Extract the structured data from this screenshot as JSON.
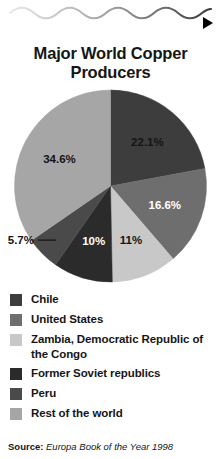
{
  "decoration": {
    "wave_name": "wavy-rule",
    "arrow_name": "right-triangle-marker"
  },
  "title": "Major World Copper Producers",
  "source": {
    "label": "Source:",
    "citation": "Europa Book of the Year 1998"
  },
  "chart_data": {
    "type": "pie",
    "title": "Major World Copper Producers",
    "unit": "percent",
    "start_angle_deg": 0,
    "direction": "clockwise",
    "categories": [
      "Chile",
      "United States",
      "Zambia, Democratic Republic of the Congo",
      "Former Soviet republics",
      "Peru",
      "Rest of the world"
    ],
    "values": [
      22.1,
      16.6,
      11,
      10,
      5.7,
      34.6
    ],
    "data_labels": [
      "22.1%",
      "16.6%",
      "11%",
      "10%",
      "5.7%",
      "34.6%"
    ],
    "colors": [
      "#3d3d3d",
      "#6e6e6e",
      "#c8c8c8",
      "#2b2b2b",
      "#4a4a4a",
      "#a6a6a6"
    ],
    "label_placement": [
      "inside",
      "inside",
      "inside",
      "inside",
      "outside",
      "inside"
    ],
    "label_text_colors": [
      "#141414",
      "#ffffff",
      "#141414",
      "#ffffff",
      "#141414",
      "#141414"
    ],
    "legend_position": "bottom",
    "source": "Europa Book of the Year 1998"
  },
  "legend": {
    "items": [
      {
        "label": "Chile",
        "color": "#3d3d3d",
        "value": 22.1
      },
      {
        "label": "United States",
        "color": "#6e6e6e",
        "value": 16.6
      },
      {
        "label": "Zambia, Democratic Republic of the Congo",
        "color": "#c8c8c8",
        "value": 11
      },
      {
        "label": "Former Soviet republics",
        "color": "#2b2b2b",
        "value": 10
      },
      {
        "label": "Peru",
        "color": "#4a4a4a",
        "value": 5.7
      },
      {
        "label": "Rest of the world",
        "color": "#a6a6a6",
        "value": 34.6
      }
    ]
  }
}
